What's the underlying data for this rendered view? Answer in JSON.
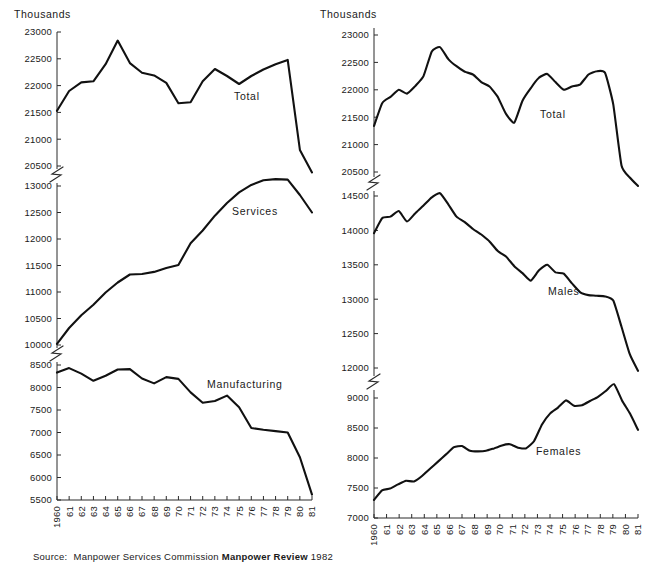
{
  "figure": {
    "units_label_left": "Thousands",
    "units_label_right": "Thousands",
    "source": {
      "label": "Source:",
      "organisation": "Manpower Services Commission",
      "publication": "Manpower Review",
      "year": "1982"
    }
  },
  "chart_data": [
    {
      "id": "left",
      "type": "line",
      "title": "",
      "xlabel": "",
      "ylabel": "Thousands",
      "grid": false,
      "legend_position": "inline-annotation",
      "axis_breaks": [
        [
          20500,
          13000
        ],
        [
          10000,
          8500
        ]
      ],
      "x": [
        "1960",
        "61",
        "62",
        "63",
        "64",
        "65",
        "66",
        "67",
        "68",
        "69",
        "70",
        "71",
        "72",
        "73",
        "74",
        "75",
        "76",
        "77",
        "78",
        "79",
        "80",
        "81"
      ],
      "ytick_labels": [
        "23000",
        "22500",
        "22000",
        "21500",
        "21000",
        "20500",
        "13000",
        "12500",
        "12000",
        "11500",
        "11000",
        "10500",
        "10000",
        "8500",
        "8000",
        "7500",
        "7000",
        "6500",
        "6000",
        "5500"
      ],
      "ylim_segments": [
        [
          20500,
          23000
        ],
        [
          10000,
          13000
        ],
        [
          5500,
          8500
        ]
      ],
      "series": [
        {
          "name": "Total",
          "label": "Total",
          "values": [
            21530,
            21900,
            22060,
            22080,
            22400,
            22840,
            22420,
            22240,
            22190,
            22050,
            21670,
            21690,
            22080,
            22310,
            22180,
            22030,
            22180,
            22300,
            22400,
            22480,
            20800,
            20380
          ]
        },
        {
          "name": "Services",
          "label": "Services",
          "values": [
            10020,
            10320,
            10560,
            10760,
            10990,
            11180,
            11330,
            11340,
            11380,
            11450,
            11510,
            11920,
            12160,
            12440,
            12680,
            12880,
            13020,
            13110,
            13130,
            13120,
            12830,
            12500
          ]
        },
        {
          "name": "Manufacturing",
          "label": "Manufacturing",
          "values": [
            8330,
            8430,
            8310,
            8150,
            8260,
            8400,
            8410,
            8200,
            8090,
            8230,
            8190,
            7890,
            7660,
            7700,
            7820,
            7560,
            7100,
            7060,
            7030,
            7000,
            6450,
            5620
          ]
        }
      ]
    },
    {
      "id": "right",
      "type": "line",
      "title": "",
      "xlabel": "",
      "ylabel": "Thousands",
      "grid": false,
      "legend_position": "inline-annotation",
      "axis_breaks": [
        [
          20500,
          14500
        ],
        [
          12000,
          9000
        ]
      ],
      "x": [
        "1960",
        "61",
        "62",
        "63",
        "64",
        "65",
        "66",
        "67",
        "68",
        "69",
        "70",
        "71",
        "72",
        "73",
        "74",
        "75",
        "76",
        "77",
        "78",
        "79",
        "80",
        "81"
      ],
      "ytick_labels": [
        "23000",
        "22500",
        "22000",
        "21500",
        "21000",
        "20500",
        "14500",
        "14000",
        "13500",
        "13000",
        "12500",
        "12000",
        "9000",
        "8500",
        "8000",
        "7500",
        "7000"
      ],
      "ylim_segments": [
        [
          20500,
          23000
        ],
        [
          12000,
          14500
        ],
        [
          7000,
          9000
        ]
      ],
      "series": [
        {
          "name": "Total",
          "label": "Total",
          "values": [
            21340,
            21760,
            21870,
            22000,
            21930,
            22070,
            22250,
            22700,
            22780,
            22560,
            22430,
            22330,
            22280,
            22140,
            22060,
            21870,
            21560,
            21400,
            21800,
            22030,
            22220,
            22290,
            22140,
            22000,
            22060,
            22100,
            22280,
            22340,
            22310,
            21730,
            20620,
            20400,
            20230
          ]
        },
        {
          "name": "Males",
          "label": "Males",
          "values": [
            13960,
            14180,
            14200,
            14280,
            14130,
            14250,
            14360,
            14480,
            14540,
            14380,
            14200,
            14120,
            14020,
            13940,
            13840,
            13700,
            13620,
            13480,
            13380,
            13270,
            13420,
            13500,
            13390,
            13370,
            13230,
            13100,
            13060,
            13050,
            13040,
            12980,
            12600,
            12200,
            11960
          ]
        },
        {
          "name": "Females",
          "label": "Females",
          "values": [
            7300,
            7460,
            7490,
            7560,
            7620,
            7610,
            7700,
            7820,
            7940,
            8060,
            8180,
            8200,
            8120,
            8110,
            8120,
            8160,
            8210,
            8230,
            8170,
            8160,
            8280,
            8560,
            8740,
            8840,
            8960,
            8870,
            8880,
            8950,
            9020,
            9120,
            9230,
            8960,
            8740,
            8470
          ]
        }
      ]
    }
  ]
}
